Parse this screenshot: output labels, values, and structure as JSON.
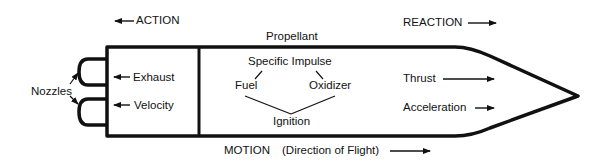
{
  "colors": {
    "stroke": "#111111",
    "background": "#ffffff"
  },
  "labels": {
    "action": "ACTION",
    "reaction": "REACTION",
    "propellant": "Propellant",
    "specific_impulse": "Specific Impulse",
    "fuel": "Fuel",
    "oxidizer": "Oxidizer",
    "ignition": "Ignition",
    "exhaust": "Exhaust",
    "velocity": "Velocity",
    "nozzles": "Nozzles",
    "thrust": "Thrust",
    "acceleration": "Acceleration",
    "motion": "MOTION",
    "direction": "(Direction of Flight)"
  },
  "icons": {
    "action_arrow": "arrow-left",
    "reaction_arrow": "arrow-right",
    "exhaust_arrow": "arrow-left",
    "velocity_arrow": "arrow-left",
    "thrust_arrow": "arrow-right",
    "acceleration_arrow": "arrow-right",
    "motion_arrow": "arrow-right"
  }
}
